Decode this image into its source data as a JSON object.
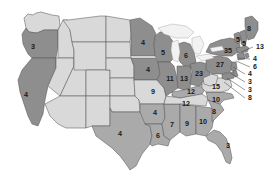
{
  "map": {
    "title": "United States Electoral Vote Map",
    "colors": {
      "shade_dark": "#8e8e8e",
      "shade_mid": "#aaaaaa",
      "shade_light": "#d9d9d9",
      "lake": "#f2f2f2",
      "border": "#5a5a5a",
      "background": "#ffffff",
      "label_text": "#1a1a1a"
    },
    "legend_note": "",
    "states": [
      {
        "id": "washington",
        "name": "Washington",
        "value": "",
        "shade": "light",
        "label_x": 48,
        "label_y": 27,
        "show_label": false
      },
      {
        "id": "oregon",
        "name": "Oregon",
        "value": "3",
        "shade": "dark",
        "label_x": 33,
        "label_y": 47,
        "show_label": true
      },
      {
        "id": "california",
        "name": "California",
        "value": "4",
        "shade": "dark",
        "label_x": 26,
        "label_y": 95,
        "show_label": true
      },
      {
        "id": "idaho",
        "name": "Idaho",
        "value": "",
        "shade": "light",
        "label_x": 62,
        "label_y": 45,
        "show_label": false
      },
      {
        "id": "nevada",
        "name": "Nevada",
        "value": "",
        "shade": "light",
        "label_x": 49,
        "label_y": 83,
        "show_label": false
      },
      {
        "id": "utah",
        "name": "Utah",
        "value": "",
        "shade": "light",
        "label_x": 70,
        "label_y": 85,
        "show_label": false
      },
      {
        "id": "arizona",
        "name": "Arizona",
        "value": "",
        "shade": "light",
        "label_x": 63,
        "label_y": 116,
        "show_label": false
      },
      {
        "id": "montana",
        "name": "Montana",
        "value": "",
        "shade": "light",
        "label_x": 88,
        "label_y": 33,
        "show_label": false
      },
      {
        "id": "wyoming",
        "name": "Wyoming",
        "value": "",
        "shade": "light",
        "label_x": 89,
        "label_y": 62,
        "show_label": false
      },
      {
        "id": "colorado",
        "name": "Colorado",
        "value": "",
        "shade": "light",
        "label_x": 93,
        "label_y": 86,
        "show_label": false
      },
      {
        "id": "new-mexico",
        "name": "New Mexico",
        "value": "",
        "shade": "light",
        "label_x": 90,
        "label_y": 116,
        "show_label": false
      },
      {
        "id": "north-dakota",
        "name": "North Dakota",
        "value": "",
        "shade": "light",
        "label_x": 117,
        "label_y": 37,
        "show_label": false
      },
      {
        "id": "south-dakota",
        "name": "South Dakota",
        "value": "",
        "shade": "light",
        "label_x": 117,
        "label_y": 55,
        "show_label": false
      },
      {
        "id": "nebraska",
        "name": "Nebraska",
        "value": "",
        "shade": "light",
        "label_x": 117,
        "label_y": 71,
        "show_label": false
      },
      {
        "id": "kansas",
        "name": "Kansas",
        "value": "",
        "shade": "light",
        "label_x": 118,
        "label_y": 88,
        "show_label": false
      },
      {
        "id": "oklahoma",
        "name": "Oklahoma",
        "value": "",
        "shade": "light",
        "label_x": 119,
        "label_y": 104,
        "show_label": false
      },
      {
        "id": "texas",
        "name": "Texas",
        "value": "4",
        "shade": "mid",
        "label_x": 120,
        "label_y": 134,
        "show_label": true
      },
      {
        "id": "minnesota",
        "name": "Minnesota",
        "value": "4",
        "shade": "dark",
        "label_x": 143,
        "label_y": 43,
        "show_label": true
      },
      {
        "id": "iowa",
        "name": "Iowa",
        "value": "4",
        "shade": "dark",
        "label_x": 148,
        "label_y": 70,
        "show_label": true
      },
      {
        "id": "missouri",
        "name": "Missouri",
        "value": "9",
        "shade": "light",
        "label_x": 153,
        "label_y": 92,
        "show_label": true
      },
      {
        "id": "arkansas",
        "name": "Arkansas",
        "value": "4",
        "shade": "mid",
        "label_x": 155,
        "label_y": 113,
        "show_label": true
      },
      {
        "id": "louisiana",
        "name": "Louisiana",
        "value": "6",
        "shade": "mid",
        "label_x": 158,
        "label_y": 136,
        "show_label": true
      },
      {
        "id": "wisconsin",
        "name": "Wisconsin",
        "value": "5",
        "shade": "dark",
        "label_x": 163,
        "label_y": 53,
        "show_label": true
      },
      {
        "id": "illinois",
        "name": "Illinois",
        "value": "11",
        "shade": "dark",
        "label_x": 170,
        "label_y": 79,
        "show_label": true
      },
      {
        "id": "mississippi",
        "name": "Mississippi",
        "value": "7",
        "shade": "mid",
        "label_x": 172,
        "label_y": 125,
        "show_label": true
      },
      {
        "id": "indiana",
        "name": "Indiana",
        "value": "13",
        "shade": "dark",
        "label_x": 184,
        "label_y": 79,
        "show_label": true
      },
      {
        "id": "michigan",
        "name": "Michigan",
        "value": "6",
        "shade": "dark",
        "label_x": 186,
        "label_y": 56,
        "show_label": true
      },
      {
        "id": "alabama",
        "name": "Alabama",
        "value": "9",
        "shade": "mid",
        "label_x": 187,
        "label_y": 124,
        "show_label": true
      },
      {
        "id": "kentucky",
        "name": "Kentucky",
        "value": "12",
        "shade": "mid",
        "label_x": 191,
        "label_y": 92,
        "show_label": true
      },
      {
        "id": "tennessee",
        "name": "Tennessee",
        "value": "12",
        "shade": "light",
        "label_x": 186,
        "label_y": 104,
        "show_label": true
      },
      {
        "id": "ohio",
        "name": "Ohio",
        "value": "23",
        "shade": "dark",
        "label_x": 199,
        "label_y": 74,
        "show_label": true
      },
      {
        "id": "georgia",
        "name": "Georgia",
        "value": "10",
        "shade": "mid",
        "label_x": 203,
        "label_y": 122,
        "show_label": true
      },
      {
        "id": "virginia",
        "name": "Virginia",
        "value": "15",
        "shade": "light",
        "label_x": 216,
        "label_y": 87,
        "show_label": true
      },
      {
        "id": "north-carolina",
        "name": "North Carolina",
        "value": "10",
        "shade": "mid",
        "label_x": 216,
        "label_y": 100,
        "show_label": true
      },
      {
        "id": "south-carolina",
        "name": "South Carolina",
        "value": "8",
        "shade": "mid",
        "label_x": 214,
        "label_y": 112,
        "show_label": true
      },
      {
        "id": "florida",
        "name": "Florida",
        "value": "3",
        "shade": "mid",
        "label_x": 228,
        "label_y": 146,
        "show_label": true
      },
      {
        "id": "pennsylvania",
        "name": "Pennsylvania",
        "value": "27",
        "shade": "dark",
        "label_x": 220,
        "label_y": 65,
        "show_label": true
      },
      {
        "id": "new-york",
        "name": "New York",
        "value": "35",
        "shade": "dark",
        "label_x": 228,
        "label_y": 51,
        "show_label": true
      },
      {
        "id": "vermont-nh",
        "name": "Vermont / New Hampshire",
        "value": "5",
        "shade": "dark",
        "label_x": 238,
        "label_y": 40,
        "show_label": true
      },
      {
        "id": "new-hampshire",
        "name": "New Hampshire",
        "value": "5",
        "shade": "dark",
        "label_x": 244,
        "label_y": 44,
        "show_label": true
      },
      {
        "id": "maine",
        "name": "Maine",
        "value": "8",
        "shade": "dark",
        "label_x": 249,
        "label_y": 29,
        "show_label": true
      }
    ],
    "callouts": [
      {
        "id": "callout-massachusetts",
        "name": "Massachusetts",
        "value": "13",
        "label_x": 256,
        "label_y": 47,
        "tip_x": 241,
        "tip_y": 52
      },
      {
        "id": "callout-rhode-island",
        "name": "Rhode Island",
        "value": "4",
        "label_x": 253,
        "label_y": 59,
        "tip_x": 238,
        "tip_y": 58
      },
      {
        "id": "callout-connecticut",
        "name": "Connecticut",
        "value": "6",
        "label_x": 253,
        "label_y": 67,
        "tip_x": 236,
        "tip_y": 61
      },
      {
        "id": "callout-new-jersey",
        "name": "New Jersey",
        "value": "4",
        "label_x": 248,
        "label_y": 74,
        "tip_x": 233,
        "tip_y": 67
      },
      {
        "id": "callout-delaware",
        "name": "Delaware",
        "value": "3",
        "label_x": 248,
        "label_y": 82,
        "tip_x": 230,
        "tip_y": 73
      },
      {
        "id": "callout-maryland",
        "name": "Maryland",
        "value": "3",
        "label_x": 248,
        "label_y": 90,
        "tip_x": 227,
        "tip_y": 78
      },
      {
        "id": "callout-dc-virginia",
        "name": "District of Columbia",
        "value": "8",
        "label_x": 248,
        "label_y": 98,
        "tip_x": 224,
        "tip_y": 82
      }
    ]
  }
}
